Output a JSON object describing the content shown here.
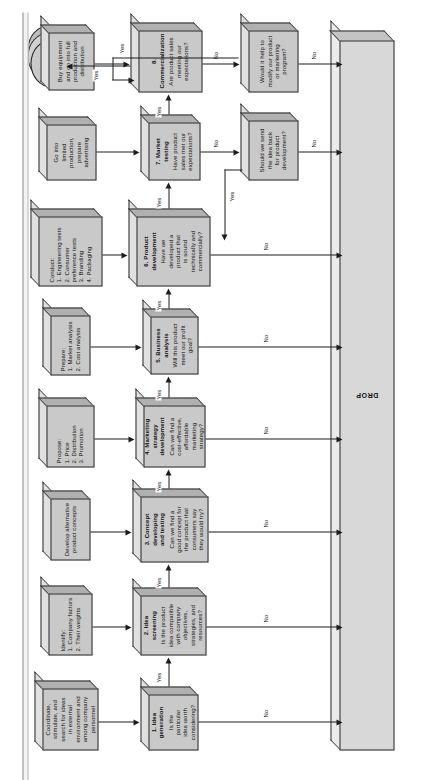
{
  "diagram": {
    "terminator": {
      "label": "Lay future plans",
      "icon": "cylinder-terminator"
    },
    "drop_bar": {
      "label": "DROP"
    },
    "input_boxes": [
      {
        "id": "in1",
        "lines": [
          "Coordinate,",
          "stimulate, and",
          "search for ideas",
          "in external",
          "environment and",
          "among company",
          "personnel"
        ]
      },
      {
        "id": "in2",
        "heading": "Identify:",
        "lines": [
          "1. Company factors",
          "2. Their weights"
        ]
      },
      {
        "id": "in3",
        "lines": [
          "Develop alternative",
          "product concepts"
        ]
      },
      {
        "id": "in4",
        "heading": "Propose:",
        "lines": [
          "1. Price",
          "2. Distribution",
          "3. Promotion"
        ]
      },
      {
        "id": "in5",
        "heading": "Prepare:",
        "lines": [
          "1. Market analysis",
          "2. Cost analysis"
        ]
      },
      {
        "id": "in6",
        "heading": "Conduct:",
        "lines": [
          "1. Engineering tests",
          "2. Consumer",
          "    preference tests",
          "3. Branding",
          "4. Packaging"
        ]
      },
      {
        "id": "in7",
        "lines": [
          "Go into",
          "limited",
          "production,",
          "prepare",
          "advertising"
        ]
      },
      {
        "id": "in8",
        "lines": [
          "Buy equipment",
          "and go into full",
          "production and",
          "distribution"
        ]
      }
    ],
    "stage_boxes": [
      {
        "id": "s1",
        "number": "1.",
        "title": "Idea",
        "title2": "generation",
        "question": [
          "Is the",
          "particular",
          "idea worth",
          "considering?"
        ]
      },
      {
        "id": "s2",
        "number": "2.",
        "title": "Idea",
        "title2": "screening",
        "question": [
          "Is the product",
          "idea compatible",
          "with company",
          "objectives,",
          "strategies, and",
          "resources?"
        ]
      },
      {
        "id": "s3",
        "number": "3.",
        "title": "Concept",
        "title2": "developing",
        "title3": "and testing",
        "question": [
          "Can we find a",
          "good concept for",
          "the product that",
          "consumers say",
          "they would try?"
        ]
      },
      {
        "id": "s4",
        "number": "4.",
        "title": "Marketing",
        "title2": "strategy",
        "title3": "development",
        "question": [
          "Can we find a",
          "cost-effective,",
          "affordable",
          "marketing",
          "strategy?"
        ]
      },
      {
        "id": "s5",
        "number": "5.",
        "title": "Business",
        "title2": "analysis",
        "question": [
          "Will this product",
          "meet our profit",
          "goal?"
        ]
      },
      {
        "id": "s6",
        "number": "6.",
        "title": "Product",
        "title2": "development",
        "question": [
          "Have we",
          "developed a",
          "product that",
          "is sound",
          "technically and",
          "commercially?"
        ]
      },
      {
        "id": "s7",
        "number": "7.",
        "title": "Market",
        "title2": "testing",
        "question": [
          "Have product",
          "sales met our",
          "expectations?"
        ]
      },
      {
        "id": "s8",
        "number": "8.",
        "title": "Commercialization",
        "question": [
          "Are product sales",
          "meeting our",
          "expectations?"
        ]
      }
    ],
    "feedback_boxes": [
      {
        "id": "f1",
        "lines": [
          "Should we send",
          "the idea back",
          "for product",
          "development?"
        ]
      },
      {
        "id": "f2",
        "lines": [
          "Would it help to",
          "modify our product",
          "or marketing",
          "program?"
        ]
      }
    ],
    "edge_labels": {
      "yes": "Yes",
      "no": "No"
    }
  }
}
